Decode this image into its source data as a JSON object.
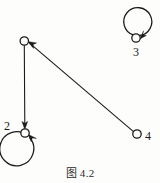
{
  "figure": {
    "caption": "图 4.2",
    "background_color": "#fdfdfc",
    "ink_color": "#1b1b1b",
    "width": 160,
    "height": 183
  },
  "graph": {
    "type": "directed-graph",
    "nodes": [
      {
        "id": "n1",
        "label": "",
        "cx": 24,
        "cy": 41,
        "r": 4.2,
        "label_position": "none",
        "has_self_loop": false
      },
      {
        "id": "n2",
        "label": "2",
        "cx": 25,
        "cy": 133,
        "r": 4.2,
        "label_position": "upper-left",
        "has_self_loop": true,
        "self_loop": {
          "cx": 25,
          "cy": 152,
          "r": 17,
          "arrow_side": "upper-right"
        }
      },
      {
        "id": "n3",
        "label": "3",
        "cx": 136,
        "cy": 38,
        "r": 4.2,
        "label_position": "below",
        "has_self_loop": true,
        "self_loop": {
          "cx": 136,
          "cy": 22,
          "r": 14,
          "arrow_side": "lower-right"
        }
      },
      {
        "id": "n4",
        "label": "4",
        "cx": 137,
        "cy": 134,
        "r": 4.2,
        "label_position": "right",
        "has_self_loop": false
      }
    ],
    "edges": [
      {
        "id": "e1",
        "from": "n1",
        "to": "n2",
        "style": "straight",
        "arrow_at": "n2"
      },
      {
        "id": "e2",
        "from": "n4",
        "to": "n1",
        "style": "straight",
        "arrow_at": "n1"
      }
    ]
  }
}
